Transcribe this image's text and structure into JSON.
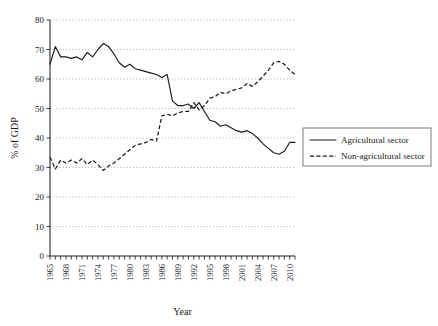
{
  "chart_data": {
    "type": "line",
    "title": "",
    "xlabel": "Year",
    "ylabel": "% of GDP",
    "xlim": [
      1965,
      2011
    ],
    "ylim": [
      0,
      80
    ],
    "yticks": [
      0,
      10,
      20,
      30,
      40,
      50,
      60,
      70,
      80
    ],
    "xticks": [
      1965,
      1968,
      1971,
      1974,
      1977,
      1980,
      1983,
      1986,
      1989,
      1992,
      1995,
      1998,
      2001,
      2004,
      2007,
      2010
    ],
    "xtick_labels": [
      "1965",
      "1968",
      "1971",
      "1974",
      "1977",
      "1980",
      "1983",
      "1986",
      "1989",
      "1992",
      "1995",
      "1998",
      "2001",
      "2004",
      "2007",
      "2010"
    ],
    "ytick_labels": [
      "0",
      "10",
      "20",
      "30",
      "40",
      "50",
      "60",
      "70",
      "80"
    ],
    "grid": true,
    "grid_axis": "y",
    "legend_position": "center-right",
    "x": [
      1965,
      1966,
      1967,
      1968,
      1969,
      1970,
      1971,
      1972,
      1973,
      1974,
      1975,
      1976,
      1977,
      1978,
      1979,
      1980,
      1981,
      1982,
      1983,
      1984,
      1985,
      1986,
      1987,
      1988,
      1989,
      1990,
      1991,
      1992,
      1993,
      1994,
      1995,
      1996,
      1997,
      1998,
      1999,
      2000,
      2001,
      2002,
      2003,
      2004,
      2005,
      2006,
      2007,
      2008,
      2009,
      2010,
      2011
    ],
    "series": [
      {
        "name": "Agricultural sector",
        "style": "solid",
        "color": "#1a1a1a",
        "values": [
          65.0,
          71.0,
          67.5,
          67.5,
          67.0,
          67.5,
          66.5,
          69.0,
          67.5,
          70.0,
          72.0,
          71.0,
          68.5,
          65.5,
          64.0,
          65.0,
          63.5,
          63.0,
          62.5,
          62.0,
          61.5,
          60.5,
          61.5,
          52.5,
          51.0,
          51.0,
          51.5,
          50.0,
          52.0,
          49.0,
          46.0,
          45.5,
          44.0,
          44.5,
          43.5,
          42.5,
          42.0,
          42.5,
          41.5,
          40.0,
          38.0,
          36.5,
          35.0,
          34.5,
          35.5,
          38.5,
          38.5
        ]
      },
      {
        "name": "Non-agricultural sector",
        "style": "dashed",
        "color": "#1a1a1a",
        "values": [
          33.5,
          29.5,
          32.5,
          31.5,
          32.5,
          31.5,
          33.0,
          31.0,
          32.5,
          31.0,
          29.0,
          30.5,
          31.5,
          33.0,
          34.5,
          36.0,
          37.5,
          38.0,
          38.5,
          39.5,
          39.0,
          47.5,
          48.0,
          47.5,
          48.5,
          49.0,
          49.0,
          52.0,
          49.5,
          51.0,
          53.5,
          54.0,
          55.5,
          55.0,
          56.0,
          56.5,
          57.0,
          58.5,
          57.5,
          59.0,
          61.0,
          63.0,
          65.5,
          66.0,
          65.0,
          63.0,
          61.5
        ]
      }
    ],
    "legend": [
      {
        "label": "Agricultural sector",
        "style": "solid"
      },
      {
        "label": "Non-agricultural sector",
        "style": "dashed"
      }
    ]
  }
}
